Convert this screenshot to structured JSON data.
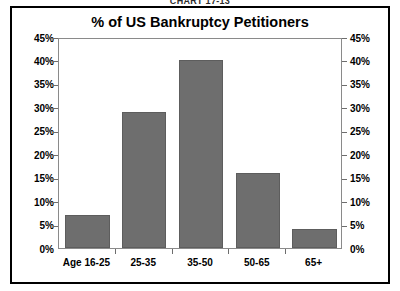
{
  "caption": "CHART 17-13",
  "chart_data": {
    "type": "bar",
    "title": "% of US Bankruptcy Petitioners",
    "xlabel": "",
    "ylabel": "",
    "categories": [
      "Age 16-25",
      "25-35",
      "35-50",
      "50-65",
      "65+"
    ],
    "values": [
      7,
      29,
      40,
      16,
      4
    ],
    "ylim": [
      0,
      45
    ],
    "ytick_labels": [
      "45%",
      "40%",
      "35%",
      "30%",
      "25%",
      "20%",
      "15%",
      "10%",
      "5%",
      "0%"
    ],
    "ytick_values": [
      45,
      40,
      35,
      30,
      25,
      20,
      15,
      10,
      5,
      0
    ],
    "right_axis_labels": [
      "45%",
      "40%",
      "35%",
      "30%",
      "25%",
      "20%",
      "15%",
      "10%",
      "5%",
      "0%"
    ],
    "grid": false,
    "legend": null,
    "bar_color": "#6e6e6e",
    "frame_color": "#000000",
    "background": "#ffffff"
  }
}
